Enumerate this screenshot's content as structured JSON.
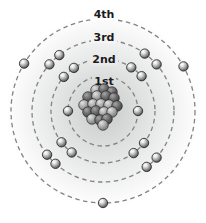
{
  "figure": {
    "canvas": {
      "width": 206,
      "height": 223
    },
    "center": {
      "x": 103,
      "y": 111
    },
    "orbit_style": {
      "color": "#838383",
      "dash": "4.5 3.5",
      "width": 1.3
    },
    "label_style": {
      "color": "#1b1b1b",
      "font_size": 11
    },
    "glow_radius": 97,
    "glow_stops": [
      {
        "offset": "0%",
        "color": "#c7cac9"
      },
      {
        "offset": "30%",
        "color": "#d9dbda"
      },
      {
        "offset": "62%",
        "color": "#ebecec"
      },
      {
        "offset": "88%",
        "color": "#f8f9f8"
      },
      {
        "offset": "100%",
        "color": "#ffffff"
      }
    ],
    "shells": [
      {
        "label": "1st",
        "radius": 35,
        "label_y": 81,
        "label_bg": "#dcdedd",
        "label_w": 24,
        "electron_angles_deg": [
          180,
          0
        ]
      },
      {
        "label": "2nd",
        "radius": 52,
        "label_y": 59,
        "label_bg": "#e9eae9",
        "label_w": 28,
        "electron_angles_deg": [
          42,
          57,
          124,
          139,
          217,
          233,
          306,
          322
        ]
      },
      {
        "label": "3rd",
        "radius": 71,
        "label_y": 37,
        "label_bg": "#f3f4f3",
        "label_w": 26,
        "electron_angles_deg": [
          41,
          54,
          128,
          139,
          218,
          228,
          308,
          319
        ]
      },
      {
        "label": "4th",
        "radius": 92,
        "label_y": 14,
        "label_bg": "#ffffff",
        "label_w": 28,
        "electron_angles_deg": [
          29,
          149,
          270
        ]
      }
    ],
    "electron_counts": {
      "1st": 2,
      "2nd": 8,
      "3rd": 8,
      "4th": 3
    },
    "electron": {
      "radius": 4.7,
      "outline": "#1f1f1f",
      "gradient": [
        "#ffffff",
        "#e8e8e8",
        "#a8a8a8",
        "#5c5c5c",
        "#3b3b3b"
      ]
    },
    "nucleus": {
      "sphere_radius": 5.3,
      "outline": "#2b2b2b",
      "dark_gradient": [
        "#a8a8a8",
        "#7d7d7d",
        "#555555",
        "#3f3f3f"
      ],
      "light_gradient": [
        "#e2e2e2",
        "#bdbdbd",
        "#8f8f8f",
        "#6f6f6f"
      ],
      "spheres": [
        {
          "x": 96,
          "y": 90,
          "shade": "light"
        },
        {
          "x": 104,
          "y": 89,
          "shade": "dark"
        },
        {
          "x": 112,
          "y": 92,
          "shade": "dark"
        },
        {
          "x": 88,
          "y": 97,
          "shade": "dark"
        },
        {
          "x": 97,
          "y": 96,
          "shade": "light"
        },
        {
          "x": 106,
          "y": 96,
          "shade": "dark"
        },
        {
          "x": 114,
          "y": 98,
          "shade": "dark"
        },
        {
          "x": 84,
          "y": 105,
          "shade": "light"
        },
        {
          "x": 93,
          "y": 104,
          "shade": "light"
        },
        {
          "x": 101,
          "y": 104,
          "shade": "light"
        },
        {
          "x": 109,
          "y": 105,
          "shade": "light"
        },
        {
          "x": 117,
          "y": 106,
          "shade": "dark"
        },
        {
          "x": 88,
          "y": 112,
          "shade": "dark"
        },
        {
          "x": 96,
          "y": 111,
          "shade": "dark"
        },
        {
          "x": 104,
          "y": 112,
          "shade": "light"
        },
        {
          "x": 112,
          "y": 112,
          "shade": "light"
        },
        {
          "x": 92,
          "y": 119,
          "shade": "light"
        },
        {
          "x": 100,
          "y": 120,
          "shade": "dark"
        },
        {
          "x": 107,
          "y": 119,
          "shade": "dark"
        },
        {
          "x": 103,
          "y": 125,
          "shade": "light"
        }
      ]
    }
  }
}
